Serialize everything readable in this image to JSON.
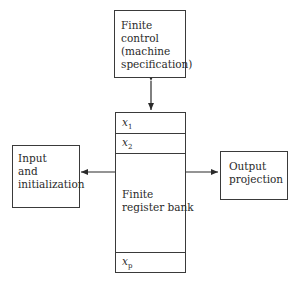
{
  "diagram": {
    "control": {
      "lines": [
        "Finite",
        "control",
        "(machine",
        "specification)"
      ]
    },
    "register_bank": {
      "label_lines": [
        "Finite",
        "register bank"
      ],
      "registers": [
        {
          "name": "x",
          "sub": "1"
        },
        {
          "name": "x",
          "sub": "2"
        },
        {
          "name": "x",
          "sub": "p"
        }
      ]
    },
    "input": {
      "lines": [
        "Input",
        "and",
        "initialization"
      ]
    },
    "output": {
      "lines": [
        "Output",
        "projection"
      ]
    },
    "edges": [
      {
        "from": "control",
        "to": "register_bank",
        "type": "bidirectional"
      },
      {
        "from": "register_bank",
        "to": "input",
        "type": "directed"
      },
      {
        "from": "register_bank",
        "to": "output",
        "type": "directed"
      }
    ]
  }
}
